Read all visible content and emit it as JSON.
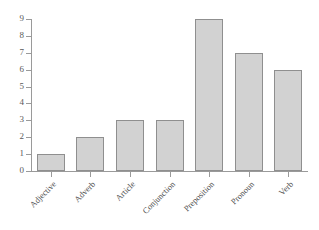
{
  "chart_data": {
    "type": "bar",
    "title": "",
    "subtitle": "",
    "xlabel": "",
    "ylabel": "",
    "categories": [
      "Adjective",
      "Adverb",
      "Article",
      "Conjunction",
      "Preposition",
      "Pronoun",
      "Verb"
    ],
    "values": [
      1,
      2,
      3,
      3,
      9,
      7,
      6
    ],
    "series": [
      {
        "name": "Count",
        "values": [
          1,
          2,
          3,
          3,
          9,
          7,
          6
        ]
      }
    ],
    "ylim": [
      0,
      9
    ],
    "y_ticks": [
      0,
      1,
      2,
      3,
      4,
      5,
      6,
      7,
      8,
      9
    ],
    "y_tick_labels": [
      "0",
      "1",
      "2",
      "3",
      "4",
      "5",
      "6",
      "7",
      "8",
      "9"
    ],
    "grid": false,
    "legend": false,
    "legend_position": "none",
    "bar_fill_color": "#d2d2d2",
    "bar_border_color": "#8f8f8f",
    "axis_color": "#9a9a9a",
    "background_color": "#ffffff",
    "text_color": "#4f4f4f",
    "x_label_rotation": -45
  }
}
